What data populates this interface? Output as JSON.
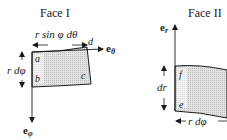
{
  "face1": {
    "title": "Face I",
    "width_label": "r sin φ dθ",
    "height_label": "r dφ",
    "corners": {
      "a": "a",
      "b": "b",
      "c": "c",
      "d": "d"
    },
    "vector_theta": "e",
    "vector_theta_sub": "θ",
    "vector_phi": "e",
    "vector_phi_sub": "φ"
  },
  "face2": {
    "title": "Face II",
    "height_label": "dr",
    "width_label": "r dφ",
    "corners": {
      "e": "e",
      "f": "f"
    },
    "vector_r": "e",
    "vector_r_sub": "r"
  },
  "colors": {
    "line": "#1a1a1a",
    "fill": "#d4d4d4"
  }
}
